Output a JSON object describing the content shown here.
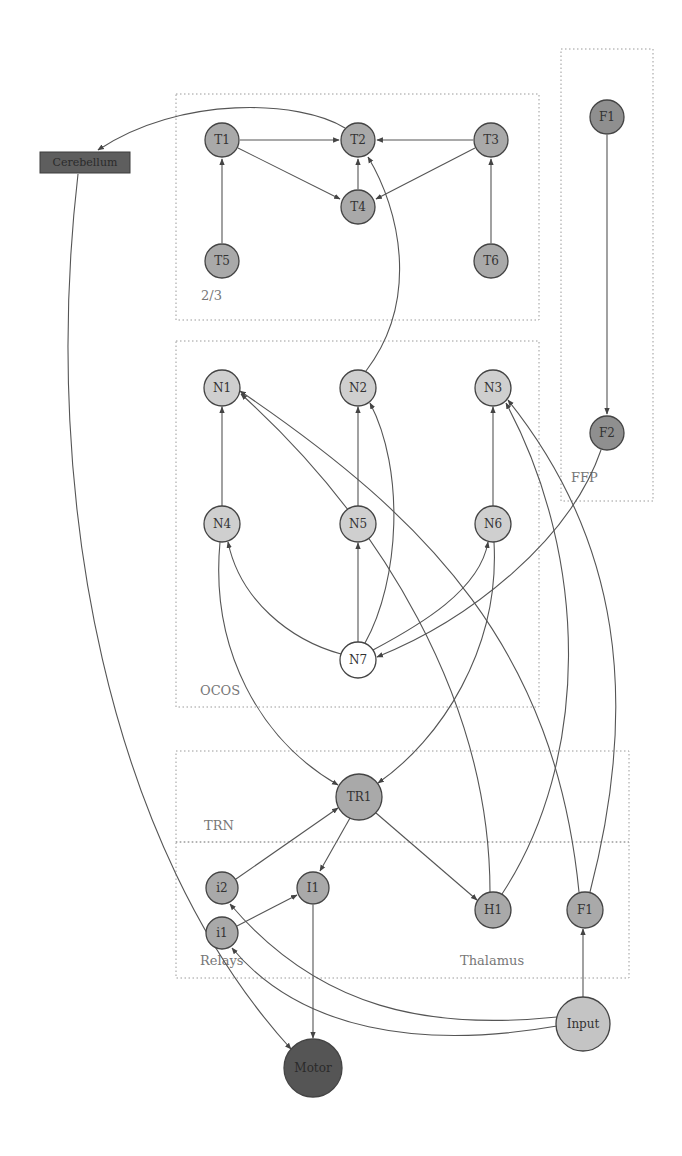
{
  "colors": {
    "light_node": "#cfcfcf",
    "mid_node": "#a9a9a9",
    "dark_node": "#8f8f8f",
    "white_node": "#ffffff",
    "motor_node": "#555555",
    "input_node": "#c4c4c4",
    "edge": "#555555",
    "group_border": "#9a9a9a",
    "group_label": "#777777"
  },
  "groups": [
    {
      "id": "layer23",
      "label": "2/3",
      "x": 176,
      "y": 94,
      "w": 363,
      "h": 226,
      "label_x": 201,
      "label_y": 300
    },
    {
      "id": "ffp",
      "label": "FFP",
      "x": 561,
      "y": 49,
      "w": 92,
      "h": 452,
      "label_x": 571,
      "label_y": 482
    },
    {
      "id": "ocos",
      "label": "OCOS",
      "x": 176,
      "y": 341,
      "w": 363,
      "h": 366,
      "label_x": 200,
      "label_y": 695
    },
    {
      "id": "trn",
      "label": "TRN",
      "x": 176,
      "y": 751,
      "w": 453,
      "h": 91,
      "label_x": 204,
      "label_y": 830
    },
    {
      "id": "thalamus",
      "label": "Thalamus",
      "x": 176,
      "y": 842,
      "w": 453,
      "h": 136,
      "label_x": 460,
      "label_y": 965
    },
    {
      "id": "relays_label",
      "label": "Relays",
      "x": 0,
      "y": 0,
      "w": 0,
      "h": 0,
      "label_x": 200,
      "label_y": 965
    }
  ],
  "nodes": [
    {
      "id": "T1",
      "label": "T1",
      "x": 222,
      "y": 140,
      "r": 17,
      "fill": "#a9a9a9"
    },
    {
      "id": "T2",
      "label": "T2",
      "x": 358,
      "y": 140,
      "r": 17,
      "fill": "#a9a9a9"
    },
    {
      "id": "T3",
      "label": "T3",
      "x": 491,
      "y": 140,
      "r": 17,
      "fill": "#a9a9a9"
    },
    {
      "id": "T4",
      "label": "T4",
      "x": 358,
      "y": 207,
      "r": 17,
      "fill": "#a9a9a9"
    },
    {
      "id": "T5",
      "label": "T5",
      "x": 222,
      "y": 261,
      "r": 17,
      "fill": "#a9a9a9"
    },
    {
      "id": "T6",
      "label": "T6",
      "x": 491,
      "y": 261,
      "r": 17,
      "fill": "#a9a9a9"
    },
    {
      "id": "F1top",
      "label": "F1",
      "x": 607,
      "y": 117,
      "r": 17,
      "fill": "#8f8f8f"
    },
    {
      "id": "F2",
      "label": "F2",
      "x": 607,
      "y": 433,
      "r": 17,
      "fill": "#8f8f8f"
    },
    {
      "id": "N1",
      "label": "N1",
      "x": 222,
      "y": 388,
      "r": 18,
      "fill": "#cfcfcf"
    },
    {
      "id": "N2",
      "label": "N2",
      "x": 358,
      "y": 388,
      "r": 18,
      "fill": "#cfcfcf"
    },
    {
      "id": "N3",
      "label": "N3",
      "x": 493,
      "y": 388,
      "r": 18,
      "fill": "#cfcfcf"
    },
    {
      "id": "N4",
      "label": "N4",
      "x": 222,
      "y": 524,
      "r": 18,
      "fill": "#cfcfcf"
    },
    {
      "id": "N5",
      "label": "N5",
      "x": 358,
      "y": 524,
      "r": 18,
      "fill": "#cfcfcf"
    },
    {
      "id": "N6",
      "label": "N6",
      "x": 493,
      "y": 524,
      "r": 18,
      "fill": "#cfcfcf"
    },
    {
      "id": "N7",
      "label": "N7",
      "x": 358,
      "y": 660,
      "r": 18,
      "fill": "#ffffff"
    },
    {
      "id": "TR1",
      "label": "TR1",
      "x": 359,
      "y": 797,
      "r": 23,
      "fill": "#a9a9a9"
    },
    {
      "id": "i2",
      "label": "i2",
      "x": 222,
      "y": 888,
      "r": 16,
      "fill": "#a9a9a9"
    },
    {
      "id": "I1",
      "label": "I1",
      "x": 313,
      "y": 888,
      "r": 16,
      "fill": "#a9a9a9"
    },
    {
      "id": "i1",
      "label": "i1",
      "x": 222,
      "y": 933,
      "r": 16,
      "fill": "#a9a9a9"
    },
    {
      "id": "H1",
      "label": "H1",
      "x": 493,
      "y": 910,
      "r": 18,
      "fill": "#a9a9a9"
    },
    {
      "id": "F1thal",
      "label": "F1",
      "x": 585,
      "y": 910,
      "r": 18,
      "fill": "#a9a9a9"
    },
    {
      "id": "Input",
      "label": "Input",
      "x": 583,
      "y": 1024,
      "r": 27,
      "fill": "#c4c4c4"
    },
    {
      "id": "Motor",
      "label": "Motor",
      "x": 313,
      "y": 1068,
      "r": 29,
      "fill": "#555555"
    }
  ],
  "cerebellum": {
    "label": "Cerebellum",
    "x": 40,
    "y": 152,
    "w": 90,
    "h": 21,
    "fill": "#5e5e5e"
  },
  "edges": [
    {
      "from": "T1",
      "to": "T2",
      "d": "M240,140 L339,140"
    },
    {
      "from": "T3",
      "to": "T2",
      "d": "M473,140 L377,140"
    },
    {
      "from": "T1",
      "to": "T4",
      "d": "M238,148 L340,199"
    },
    {
      "from": "T3",
      "to": "T4",
      "d": "M475,148 L376,199"
    },
    {
      "from": "T4",
      "to": "T2",
      "d": "M358,189 L358,159"
    },
    {
      "from": "T5",
      "to": "T1",
      "d": "M222,243 L222,159"
    },
    {
      "from": "T6",
      "to": "T3",
      "d": "M491,243 L491,159"
    },
    {
      "from": "T2",
      "to": "Cerebellum",
      "d": "M345,128 C300,100 180,95 98,150"
    },
    {
      "from": "N2",
      "to": "T2",
      "d": "M366,371 C420,300 400,210 368,157"
    },
    {
      "from": "F1top",
      "to": "F2",
      "d": "M607,135 L607,414"
    },
    {
      "from": "N4",
      "to": "N1",
      "d": "M222,506 L222,407"
    },
    {
      "from": "N5",
      "to": "N2",
      "d": "M358,506 L358,407"
    },
    {
      "from": "N6",
      "to": "N3",
      "d": "M493,506 L493,407"
    },
    {
      "from": "N7",
      "to": "N5",
      "d": "M358,642 L358,543"
    },
    {
      "from": "N7",
      "to": "N4",
      "d": "M341,654 C290,640 240,600 228,542"
    },
    {
      "from": "N7",
      "to": "N6",
      "d": "M373,650 C420,625 480,590 488,542"
    },
    {
      "from": "N7",
      "to": "N2",
      "d": "M365,643 C400,580 405,470 370,403"
    },
    {
      "from": "F2",
      "to": "N7",
      "d": "M601,450 C570,540 470,620 377,657"
    },
    {
      "from": "N4",
      "to": "TR1",
      "d": "M220,542 C210,650 260,740 338,785"
    },
    {
      "from": "N6",
      "to": "TR1",
      "d": "M494,542 C500,650 440,740 378,783"
    },
    {
      "from": "H1",
      "to": "N1",
      "d": "M490,892 C490,700 380,520 241,394"
    },
    {
      "from": "H1",
      "to": "N3",
      "d": "M502,894 C590,760 590,560 506,403"
    },
    {
      "from": "F1thal",
      "to": "N1",
      "d": "M579,892 C555,650 430,520 240,391"
    },
    {
      "from": "F1thal",
      "to": "N3",
      "d": "M590,892 C640,700 620,540 508,400"
    },
    {
      "from": "TR1",
      "to": "I1",
      "d": "M350,818 L320,871"
    },
    {
      "from": "TR1",
      "to": "H1",
      "d": "M376,813 L477,900"
    },
    {
      "from": "i2",
      "to": "TR1",
      "d": "M236,879 L338,808"
    },
    {
      "from": "i1",
      "to": "I1",
      "d": "M237,926 L297,895"
    },
    {
      "from": "I1",
      "to": "Motor",
      "d": "M313,905 L313,1038"
    },
    {
      "from": "Cerebellum",
      "to": "Motor",
      "d": "M78,174 C40,500 110,850 291,1049"
    },
    {
      "from": "Input",
      "to": "F1thal",
      "d": "M583,997 L583,929"
    },
    {
      "from": "Input",
      "to": "i2",
      "d": "M557,1017 C430,1030 320,1010 230,904"
    },
    {
      "from": "Input",
      "to": "i1",
      "d": "M557,1026 C420,1050 300,1030 232,948"
    }
  ]
}
